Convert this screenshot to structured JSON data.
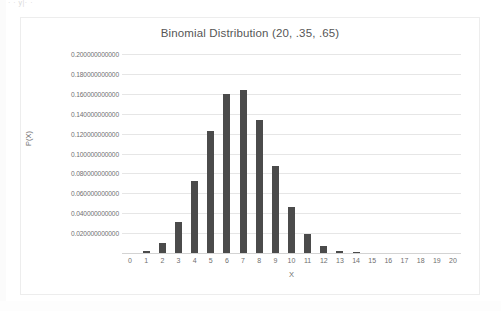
{
  "page": {
    "top_faint_text": "· ·    y|·                                                               ·",
    "background_color": "#ffffff"
  },
  "chart_data": {
    "type": "bar",
    "title": "Binomial Distribution (20, .35, .65)",
    "xlabel": "X",
    "ylabel": "P(X)",
    "grid": true,
    "legend": "none",
    "bar_color": "#4b4b4b",
    "gridline_color": "#e6e6e6",
    "xlim": [
      -0.5,
      20.5
    ],
    "ylim": [
      0,
      0.2
    ],
    "categories": [
      "0",
      "1",
      "2",
      "3",
      "4",
      "5",
      "6",
      "7",
      "8",
      "9",
      "10",
      "11",
      "12",
      "13",
      "14",
      "15",
      "16",
      "17",
      "18",
      "19",
      "20"
    ],
    "values": [
      0.000177917621,
      0.001916728223,
      0.009800879217,
      0.031611279469,
      0.072217733996,
      0.122448498148,
      0.159775073885,
      0.163906229447,
      0.133798802441,
      0.087387640443,
      0.045986294971,
      0.019467472994,
      0.006550290392,
      0.001714268333,
      0.000340080455,
      4.8850989e-05,
      4.802595e-06,
      2.89028e-07,
      8.649e-09,
      9.8e-11,
      0.0
    ],
    "ytick_labels": [
      "0.020000000000",
      "0.040000000000",
      "0.060000000000",
      "0.080000000000",
      "0.100000000000",
      "0.120000000000",
      "0.140000000000",
      "0.160000000000",
      "0.180000000000",
      "0.200000000000"
    ],
    "ytick_values": [
      0.02,
      0.04,
      0.06,
      0.08,
      0.1,
      0.12,
      0.14,
      0.16,
      0.18,
      0.2
    ],
    "xtick_labels": [
      "0",
      "1",
      "2",
      "3",
      "4",
      "5",
      "6",
      "7",
      "8",
      "9",
      "10",
      "11",
      "12",
      "13",
      "14",
      "15",
      "16",
      "17",
      "18",
      "19",
      "20"
    ]
  }
}
